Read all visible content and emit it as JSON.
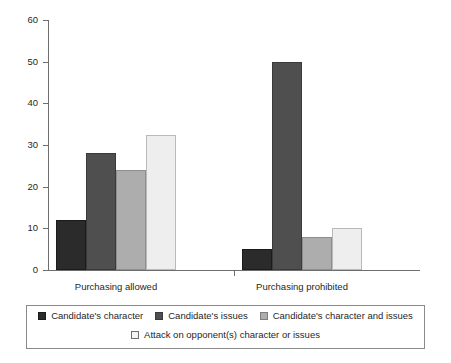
{
  "chart_data": {
    "type": "bar",
    "title": "",
    "subtitle": "",
    "xlabel": "",
    "ylabel": "",
    "categories": [
      "Purchasing allowed",
      "Purchasing prohibited"
    ],
    "series": [
      {
        "name": "Candidate's character",
        "color": "#2b2b2b",
        "values": [
          12,
          5
        ]
      },
      {
        "name": "Candidate's issues",
        "color": "#4f4f4f",
        "values": [
          28,
          50
        ]
      },
      {
        "name": "Candidate's character and issues",
        "color": "#adadad",
        "values": [
          24,
          8
        ]
      },
      {
        "name": "Attack on opponent(s) character or issues",
        "color": "#eeeeee",
        "values": [
          32.5,
          10
        ]
      }
    ],
    "ylim": [
      0,
      60
    ],
    "yticks": [
      0,
      10,
      20,
      30,
      40,
      50,
      60
    ],
    "ytick_labels": [
      "0",
      "10",
      "20",
      "30",
      "40",
      "50",
      "60"
    ],
    "grid": false,
    "legend_position": "bottom",
    "legend_rows": [
      [
        "Candidate's character",
        "Candidate's issues",
        "Candidate's character and issues"
      ],
      [
        "Attack on opponent(s) character or issues"
      ]
    ]
  }
}
